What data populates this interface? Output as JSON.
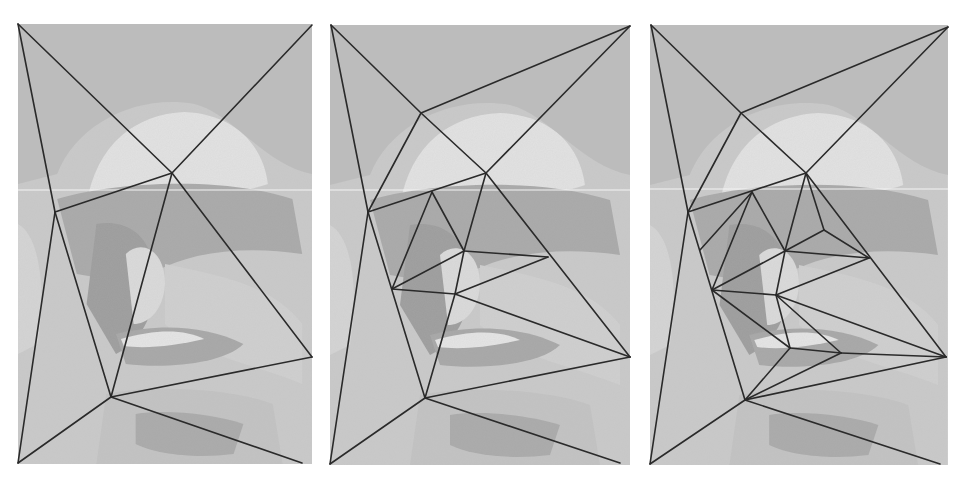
{
  "figure": {
    "colors": {
      "background": "#ffffff",
      "photo_light": "#dcdcdc",
      "photo_mid": "#bdbdbd",
      "photo_dark": "#9e9e9e",
      "mesh_line": "#2a2a2a",
      "scanline": "#f4f4f4"
    },
    "panels": [
      {
        "id": "panel-1",
        "label": "coarse mesh",
        "rect": {
          "x": 18,
          "y": 24,
          "w": 294,
          "h": 440
        },
        "vertices": {
          "TL": [
            18,
            24
          ],
          "TR": [
            312,
            25
          ],
          "BL": [
            18,
            463
          ],
          "BR": [
            302,
            463
          ],
          "A": [
            172,
            173
          ],
          "B": [
            55,
            212
          ],
          "C": [
            111,
            397
          ],
          "D": [
            312,
            357
          ]
        },
        "edges": [
          [
            "TL",
            "A"
          ],
          [
            "TR",
            "A"
          ],
          [
            "TL",
            "B"
          ],
          [
            "B",
            "A"
          ],
          [
            "B",
            "C"
          ],
          [
            "A",
            "C"
          ],
          [
            "A",
            "D"
          ],
          [
            "C",
            "D"
          ],
          [
            "C",
            "BR"
          ],
          [
            "C",
            "BL"
          ],
          [
            "B",
            "BL"
          ]
        ]
      },
      {
        "id": "panel-2",
        "label": "refined mesh",
        "rect": {
          "x": 330,
          "y": 25,
          "w": 300,
          "h": 440
        },
        "vertices": {
          "TL": [
            331,
            25
          ],
          "TR": [
            630,
            26
          ],
          "BL": [
            330,
            464
          ],
          "BR": [
            620,
            463
          ],
          "E": [
            421,
            113
          ],
          "A": [
            486,
            173
          ],
          "B": [
            368,
            212
          ],
          "F": [
            432,
            192
          ],
          "G": [
            464,
            251
          ],
          "H": [
            548,
            257
          ],
          "I": [
            392,
            289
          ],
          "J": [
            455,
            294
          ],
          "C": [
            425,
            398
          ],
          "D": [
            630,
            357
          ]
        },
        "edges": [
          [
            "TL",
            "E"
          ],
          [
            "E",
            "TR"
          ],
          [
            "E",
            "A"
          ],
          [
            "TR",
            "A"
          ],
          [
            "TL",
            "B"
          ],
          [
            "E",
            "B"
          ],
          [
            "B",
            "A"
          ],
          [
            "F",
            "I"
          ],
          [
            "F",
            "G"
          ],
          [
            "A",
            "G"
          ],
          [
            "A",
            "D"
          ],
          [
            "G",
            "H"
          ],
          [
            "G",
            "I"
          ],
          [
            "I",
            "J"
          ],
          [
            "J",
            "H"
          ],
          [
            "G",
            "J"
          ],
          [
            "J",
            "C"
          ],
          [
            "B",
            "C"
          ],
          [
            "B",
            "BL"
          ],
          [
            "C",
            "BL"
          ],
          [
            "C",
            "BR"
          ],
          [
            "C",
            "D"
          ],
          [
            "J",
            "D"
          ]
        ]
      },
      {
        "id": "panel-3",
        "label": "further refined mesh",
        "rect": {
          "x": 650,
          "y": 25,
          "w": 298,
          "h": 440
        },
        "vertices": {
          "TL": [
            651,
            25
          ],
          "TR": [
            948,
            27
          ],
          "BL": [
            650,
            464
          ],
          "BR": [
            940,
            464
          ],
          "E": [
            741,
            113
          ],
          "A": [
            806,
            173
          ],
          "B": [
            688,
            212
          ],
          "F": [
            752,
            192
          ],
          "K": [
            824,
            230
          ],
          "G": [
            785,
            251
          ],
          "H": [
            869,
            258
          ],
          "N": [
            700,
            250
          ],
          "I": [
            712,
            290
          ],
          "J": [
            776,
            295
          ],
          "L": [
            790,
            348
          ],
          "M": [
            841,
            353
          ],
          "C": [
            745,
            400
          ],
          "D": [
            946,
            357
          ]
        },
        "edges": [
          [
            "TL",
            "E"
          ],
          [
            "E",
            "TR"
          ],
          [
            "E",
            "A"
          ],
          [
            "TR",
            "A"
          ],
          [
            "TL",
            "B"
          ],
          [
            "E",
            "B"
          ],
          [
            "B",
            "A"
          ],
          [
            "F",
            "N"
          ],
          [
            "F",
            "G"
          ],
          [
            "F",
            "I"
          ],
          [
            "A",
            "G"
          ],
          [
            "A",
            "K"
          ],
          [
            "K",
            "G"
          ],
          [
            "K",
            "H"
          ],
          [
            "A",
            "D"
          ],
          [
            "G",
            "H"
          ],
          [
            "G",
            "I"
          ],
          [
            "I",
            "J"
          ],
          [
            "J",
            "H"
          ],
          [
            "G",
            "J"
          ],
          [
            "I",
            "L"
          ],
          [
            "J",
            "L"
          ],
          [
            "J",
            "M"
          ],
          [
            "L",
            "M"
          ],
          [
            "M",
            "D"
          ],
          [
            "M",
            "C"
          ],
          [
            "L",
            "C"
          ],
          [
            "B",
            "C"
          ],
          [
            "B",
            "BL"
          ],
          [
            "C",
            "BL"
          ],
          [
            "C",
            "BR"
          ],
          [
            "C",
            "D"
          ],
          [
            "J",
            "D"
          ]
        ]
      }
    ]
  }
}
